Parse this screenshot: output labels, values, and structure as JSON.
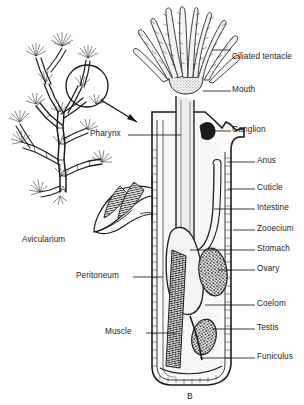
{
  "figure": {
    "title_panels": [
      {
        "id": "A",
        "label": "A",
        "caption": "colony branch habit"
      },
      {
        "id": "B",
        "label": "B",
        "caption": "single zooid internal anatomy"
      }
    ],
    "panel_a_label": "A",
    "panel_b_label": "B"
  },
  "labels_right": [
    {
      "name": "ciliated-tentacle",
      "text": "Ciliated tentacle",
      "x": 232,
      "y": 53
    },
    {
      "name": "mouth",
      "text": "Mouth",
      "x": 232,
      "y": 95
    },
    {
      "name": "ganglion",
      "text": "Ganglion",
      "x": 232,
      "y": 127
    },
    {
      "name": "anus",
      "text": "Anus",
      "x": 256,
      "y": 166
    },
    {
      "name": "cuticle",
      "text": "Cuticle",
      "x": 256,
      "y": 193
    },
    {
      "name": "intestine",
      "text": "Intestine",
      "x": 256,
      "y": 213
    },
    {
      "name": "zooecium",
      "text": "Zooecium",
      "x": 256,
      "y": 234
    },
    {
      "name": "stomach",
      "text": "Stomach",
      "x": 256,
      "y": 254
    },
    {
      "name": "ovary",
      "text": "Ovary",
      "x": 256,
      "y": 274
    },
    {
      "name": "coelom",
      "text": "Coelom",
      "x": 256,
      "y": 309
    },
    {
      "name": "testis",
      "text": "Testis",
      "x": 256,
      "y": 333
    },
    {
      "name": "funiculus",
      "text": "Funiculus",
      "x": 256,
      "y": 362
    }
  ],
  "labels_left": [
    {
      "name": "pharynx",
      "text": "Pharynx",
      "x": 92,
      "y": 139
    },
    {
      "name": "avicularium",
      "text": "Avicularium",
      "x": 22,
      "y": 241
    },
    {
      "name": "peritoneum",
      "text": "Peritoneum",
      "x": 78,
      "y": 281
    },
    {
      "name": "muscle",
      "text": "Muscle",
      "x": 107,
      "y": 337
    }
  ],
  "colors": {
    "ink": "#1a1a1a",
    "background": "#ffffff",
    "stipple": "#8d8d8d",
    "fill_light": "#f2f1ef",
    "fill_mid": "#dcdad6"
  }
}
